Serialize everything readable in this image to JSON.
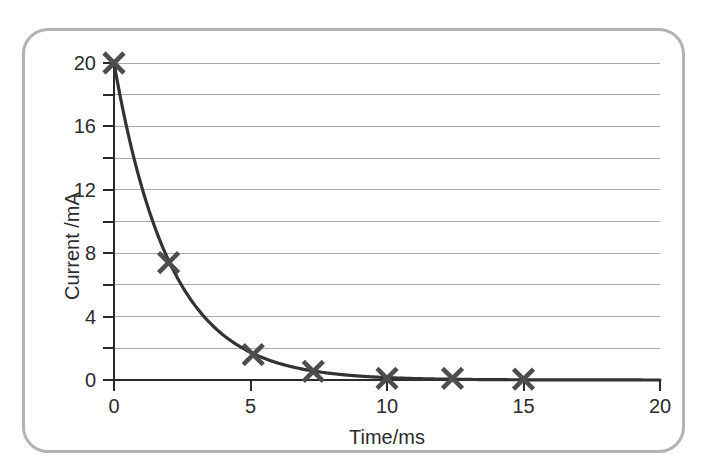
{
  "figure": {
    "border_color": "#b3b3b3",
    "background_color": "#ffffff"
  },
  "chart_data": {
    "type": "scatter",
    "title": "",
    "subtitle": "",
    "xlabel": "Time/ms",
    "ylabel": "Current /mA",
    "xlim": [
      0,
      20
    ],
    "ylim": [
      0,
      20
    ],
    "x_ticks": [
      0,
      5,
      10,
      15,
      20
    ],
    "x_tick_labels": [
      "0",
      "5",
      "10",
      "15",
      "20"
    ],
    "y_ticks": [
      0,
      4,
      8,
      12,
      16,
      20
    ],
    "y_tick_labels": [
      "0",
      "4",
      "8",
      "12",
      "16",
      "20"
    ],
    "y_minor_ticks": [
      2,
      6,
      10,
      14,
      18
    ],
    "gridlines": {
      "horizontal": [
        0,
        2,
        4,
        6,
        8,
        10,
        12,
        14,
        16,
        18,
        20
      ],
      "vertical": [],
      "color": "#aaaaaa"
    },
    "series": [
      {
        "name": "Current decay",
        "marker": "x",
        "marker_color": "#4d4d4d",
        "line_color": "#333333",
        "points": [
          {
            "x": 0.0,
            "y": 20.0
          },
          {
            "x": 2.0,
            "y": 7.4
          },
          {
            "x": 5.1,
            "y": 1.6
          },
          {
            "x": 7.3,
            "y": 0.55
          },
          {
            "x": 10.0,
            "y": 0.1
          },
          {
            "x": 12.4,
            "y": 0.1
          },
          {
            "x": 15.0,
            "y": 0.05
          }
        ],
        "fitted_curve": {
          "model": "exponential_decay",
          "equation": "I = 20 * exp(-t / 2.05)",
          "initial_value": 20.0,
          "time_constant": 2.05
        }
      }
    ],
    "axis_color": "#2b2b2b",
    "legend": null,
    "legend_position": "none"
  }
}
